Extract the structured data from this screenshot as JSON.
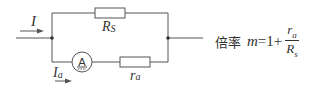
{
  "diagram": {
    "labels": {
      "total_current": "I",
      "shunt_resistor_main": "R",
      "shunt_resistor_sub": "S",
      "meter_current_main": "I",
      "meter_current_sub": "a",
      "internal_resistor_main": "r",
      "internal_resistor_sub": "a",
      "ammeter_symbol": "A"
    },
    "formula": {
      "prefix": "倍率",
      "variable": "m",
      "equals_one_plus": "=1+",
      "numerator_main": "r",
      "numerator_sub": "a",
      "denominator_main": "R",
      "denominator_sub": "s"
    },
    "colors": {
      "wire": "#555555",
      "text": "#333333",
      "background": "#ffffff"
    }
  }
}
